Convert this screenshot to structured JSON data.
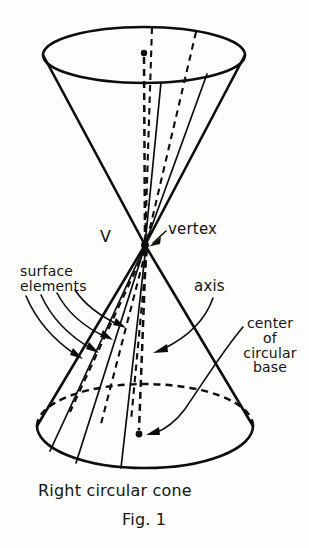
{
  "figure": {
    "caption": "Right circular cone",
    "figure_number": "Fig. 1",
    "labels": {
      "vertex": "vertex",
      "vertex_point": "V",
      "surface_elements": "surface\nelements",
      "axis": "axis",
      "center_of_base": "center\nof\ncircular\nbase"
    },
    "colors": {
      "ink": "#0d0d0d",
      "paper": "#fdfdfc"
    },
    "geometry": {
      "top_ellipse": {
        "cx": 144,
        "cy": 55,
        "rx": 101,
        "ry": 28
      },
      "base_ellipse": {
        "cx": 145,
        "cy": 426,
        "rx": 108,
        "ry": 42
      },
      "vertex": {
        "x": 145,
        "y": 245
      },
      "top_center_dot": {
        "x": 144,
        "y": 53
      },
      "base_center_dot": {
        "x": 139,
        "y": 434
      }
    }
  }
}
